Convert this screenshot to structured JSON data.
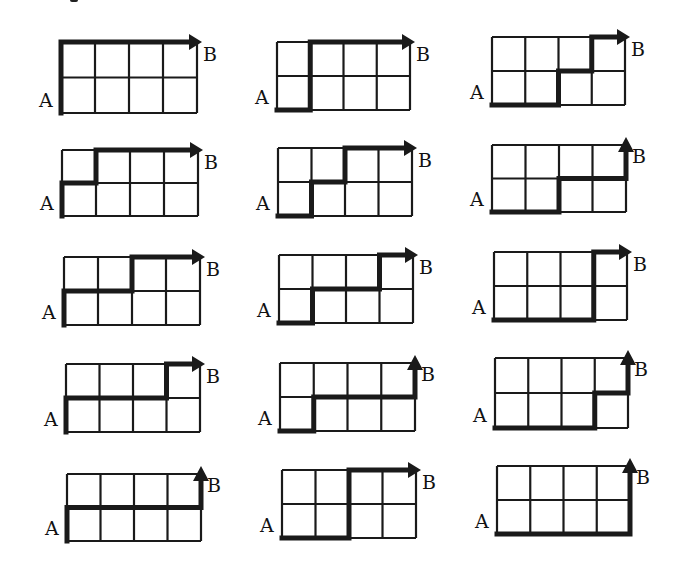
{
  "diagram": {
    "grid": {
      "cols": 4,
      "rows": 2
    },
    "start_label": "A",
    "end_label": "B",
    "colors": {
      "line": "#1a1a1a",
      "background": "#ffffff"
    },
    "move_legend": {
      "R": "right one unit",
      "U": "up one unit"
    },
    "paths": [
      {
        "id": 1,
        "moves": "UURRRR",
        "x": 61,
        "y": 42,
        "w": 136,
        "h": 71
      },
      {
        "id": 2,
        "moves": "RUURRR",
        "x": 277,
        "y": 42,
        "w": 133,
        "h": 68
      },
      {
        "id": 3,
        "moves": "RRURUR",
        "x": 492,
        "y": 37,
        "w": 133,
        "h": 68
      },
      {
        "id": 4,
        "moves": "URURRR",
        "x": 62,
        "y": 150,
        "w": 136,
        "h": 66
      },
      {
        "id": 5,
        "moves": "RURURR",
        "x": 278,
        "y": 148,
        "w": 134,
        "h": 68
      },
      {
        "id": 6,
        "moves": "RRURRU",
        "x": 492,
        "y": 145,
        "w": 134,
        "h": 67
      },
      {
        "id": 7,
        "moves": "URRURR",
        "x": 64,
        "y": 257,
        "w": 136,
        "h": 68
      },
      {
        "id": 8,
        "moves": "RURRUR",
        "x": 279,
        "y": 255,
        "w": 134,
        "h": 68
      },
      {
        "id": 9,
        "moves": "RRRUUR",
        "x": 494,
        "y": 252,
        "w": 133,
        "h": 68
      },
      {
        "id": 10,
        "moves": "URRRUR",
        "x": 66,
        "y": 364,
        "w": 134,
        "h": 68
      },
      {
        "id": 11,
        "moves": "RURRRU",
        "x": 280,
        "y": 363,
        "w": 135,
        "h": 68
      },
      {
        "id": 12,
        "moves": "RRRURU",
        "x": 495,
        "y": 358,
        "w": 133,
        "h": 70
      },
      {
        "id": 13,
        "moves": "URRRRU",
        "x": 67,
        "y": 474,
        "w": 134,
        "h": 67
      },
      {
        "id": 14,
        "moves": "RRUURR",
        "x": 282,
        "y": 470,
        "w": 134,
        "h": 68
      },
      {
        "id": 15,
        "moves": "RRRRUU",
        "x": 497,
        "y": 466,
        "w": 133,
        "h": 68
      }
    ]
  }
}
